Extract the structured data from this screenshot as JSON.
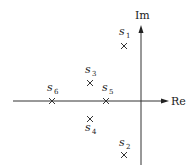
{
  "diagram": {
    "type": "complex-plane-pole-plot",
    "axes": {
      "real_label": "Re",
      "imag_label": "Im"
    },
    "points": [
      {
        "id": "s1",
        "name": "s",
        "sub": "1",
        "marker": "×",
        "quadrant": "upper-left-near-axis"
      },
      {
        "id": "s2",
        "name": "s",
        "sub": "2",
        "marker": "×",
        "quadrant": "lower-left-near-axis"
      },
      {
        "id": "s3",
        "name": "s",
        "sub": "3",
        "marker": "×",
        "quadrant": "upper-left"
      },
      {
        "id": "s4",
        "name": "s",
        "sub": "4",
        "marker": "×",
        "quadrant": "lower-left"
      },
      {
        "id": "s5",
        "name": "s",
        "sub": "5",
        "marker": "×",
        "quadrant": "on-real-axis"
      },
      {
        "id": "s6",
        "name": "s",
        "sub": "6",
        "marker": "×",
        "quadrant": "on-real-axis-far-left"
      }
    ]
  }
}
